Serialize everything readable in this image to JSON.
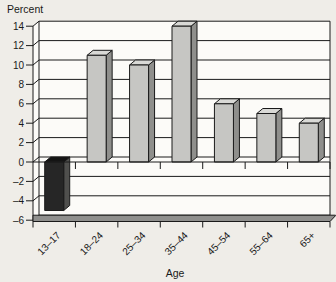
{
  "chart_data": {
    "type": "bar",
    "subtype": "3d-column",
    "title": "",
    "ylabel": "Percent",
    "xlabel": "Age",
    "categories": [
      "13–17",
      "18–24",
      "25–34",
      "35–44",
      "45–54",
      "55–64",
      "65+"
    ],
    "values": [
      -5,
      11,
      10,
      14,
      6,
      5,
      4
    ],
    "ylim": [
      -6,
      14
    ],
    "yticks": [
      14,
      12,
      10,
      8,
      6,
      4,
      2,
      0,
      -2,
      -4,
      -6
    ],
    "grid": true,
    "legend": false,
    "colors": {
      "positive_front": "#c6c6c3",
      "positive_side": "#8f8f8c",
      "positive_top": "#d9d9d6",
      "negative_front": "#262626",
      "negative_side": "#4f4f4d",
      "negative_top": "#141414",
      "floor": "#8f8f8d",
      "outline": "#1a1a1a",
      "plot_bg": "#fcfbf8",
      "page_bg": "#efede8",
      "text": "#1a1a1a"
    }
  }
}
